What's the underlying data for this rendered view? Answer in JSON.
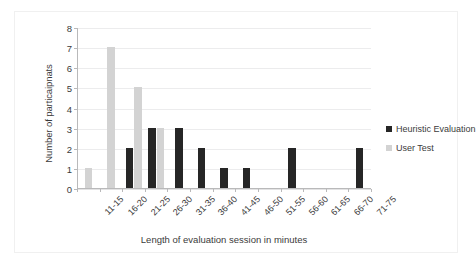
{
  "chart_data": {
    "type": "bar",
    "title": "",
    "xlabel": "Length of evaluation session in minutes",
    "ylabel": "Number of particaipnats",
    "categories": [
      "11-15",
      "16-20",
      "21-25",
      "26-30",
      "31-35",
      "36-40",
      "41-45",
      "46-50",
      "51-55",
      "56-60",
      "61-65",
      "66-70",
      "71-75"
    ],
    "series": [
      {
        "name": "Heuristic Evaluation",
        "color": "#262626",
        "values": [
          0,
          0,
          2,
          3,
          3,
          2,
          1,
          1,
          0,
          2,
          0,
          0,
          2
        ]
      },
      {
        "name": "User Test",
        "color": "#d3d3d3",
        "values": [
          1,
          7,
          5,
          3,
          0,
          0,
          0,
          0,
          0,
          0,
          0,
          0,
          0
        ]
      }
    ],
    "ylim": [
      0,
      8
    ],
    "yticks": [
      0,
      1,
      2,
      3,
      4,
      5,
      6,
      7,
      8
    ],
    "ytick_labels": [
      "0",
      "1",
      "2",
      "3",
      "4",
      "5",
      "6",
      "7",
      "8"
    ],
    "grid": true,
    "grid_axis": "y",
    "legend_position": "right",
    "xtick_rotation": -45
  },
  "legend": {
    "entries": [
      {
        "label": "Heuristic Evaluation",
        "swatch": "dark"
      },
      {
        "label": "User Test",
        "swatch": "light"
      }
    ]
  }
}
